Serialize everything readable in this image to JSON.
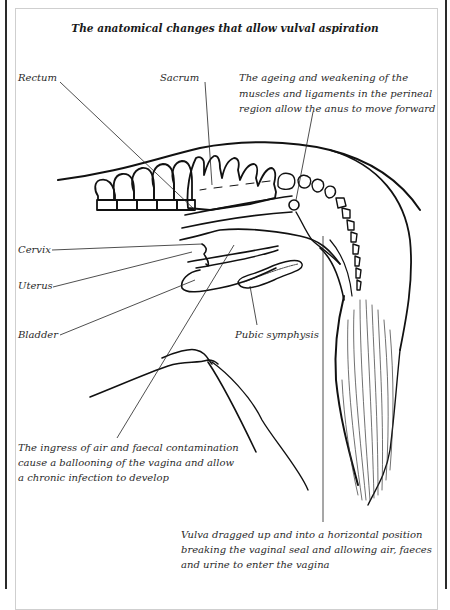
{
  "figure": {
    "title": "The anatomical changes that allow vulval aspiration",
    "labels": {
      "rectum": "Rectum",
      "sacrum": "Sacrum",
      "cervix": "Cervix",
      "uterus": "Uterus",
      "bladder": "Bladder",
      "pubic_symphysis": "Pubic symphysis"
    },
    "annotations": {
      "anus": [
        "The ageing and weakening of the",
        "muscles and ligaments in the perineal",
        "region allow the anus to move forward"
      ],
      "ingress": [
        "The ingress of air and faecal contamination",
        "cause a ballooning of the vagina and allow",
        "a chronic infection to develop"
      ],
      "vulva": [
        "Vulva dragged up and into a horizontal position",
        "breaking the vaginal seal and allowing air, faeces",
        "and urine to enter the vagina"
      ]
    }
  }
}
